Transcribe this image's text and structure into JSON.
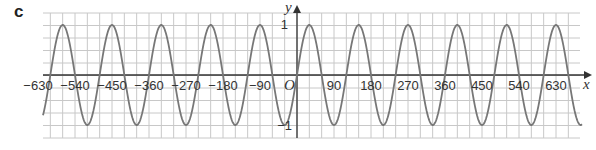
{
  "part_label": "c",
  "chart_data": {
    "type": "line",
    "title": "",
    "function": "y = sin(3x)",
    "xlabel": "x",
    "ylabel": "y",
    "origin_label": "O",
    "xlim": [
      -660,
      660
    ],
    "ylim": [
      -1.2,
      1.2
    ],
    "grid": true,
    "x_ticks": [
      -630,
      -540,
      -450,
      -360,
      -270,
      -180,
      -90,
      90,
      180,
      270,
      360,
      450,
      540,
      630
    ],
    "x_tick_labels": [
      "−630",
      "−540",
      "−450",
      "−360",
      "−270",
      "−180",
      "−90",
      "90",
      "180",
      "270",
      "360",
      "450",
      "540",
      "630"
    ],
    "y_ticks": [
      1,
      -1
    ],
    "y_tick_labels": [
      "1",
      "−1"
    ],
    "series": [
      {
        "name": "y = sin 3x",
        "period": 120,
        "amplitude": 1
      }
    ]
  }
}
